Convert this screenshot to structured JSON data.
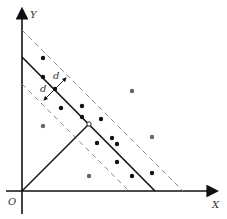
{
  "diagram": {
    "axis_labels": {
      "y": "Y",
      "x": "X",
      "origin": "O"
    },
    "margin_label_upper": "d",
    "margin_label_lower": "d",
    "colors": {
      "axis": "#111111",
      "hyperplane": "#111111",
      "margin": "#888888",
      "point_dark": "#111111",
      "point_gray": "#666666"
    },
    "points_dark": [
      [
        43,
        58
      ],
      [
        43,
        77
      ],
      [
        55,
        89
      ],
      [
        61,
        108
      ],
      [
        82,
        106
      ],
      [
        82,
        117
      ],
      [
        101,
        119
      ],
      [
        97,
        143
      ],
      [
        112,
        138
      ],
      [
        117,
        144
      ],
      [
        117,
        162
      ],
      [
        132,
        176
      ],
      [
        152,
        173
      ]
    ],
    "points_gray": [
      [
        132,
        91
      ],
      [
        43,
        126
      ],
      [
        89,
        176
      ],
      [
        152,
        137
      ]
    ],
    "support_vector_foot": [
      89,
      124
    ]
  }
}
